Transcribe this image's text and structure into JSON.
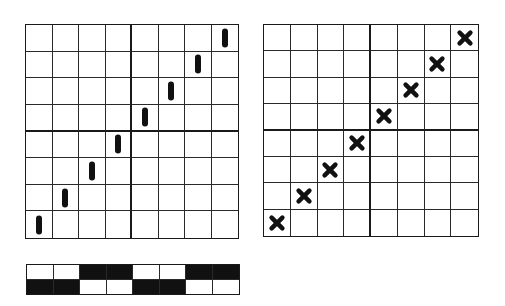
{
  "diagram": {
    "left_grid": {
      "rows": 8,
      "cols": 8,
      "mark_type": "vertical-bar",
      "marks": [
        {
          "row": 7,
          "col": 0
        },
        {
          "row": 6,
          "col": 1
        },
        {
          "row": 5,
          "col": 2
        },
        {
          "row": 4,
          "col": 3
        },
        {
          "row": 3,
          "col": 4
        },
        {
          "row": 2,
          "col": 5
        },
        {
          "row": 1,
          "col": 6
        },
        {
          "row": 0,
          "col": 7
        }
      ]
    },
    "right_grid": {
      "rows": 8,
      "cols": 8,
      "mark_type": "x-cross",
      "marks": [
        {
          "row": 7,
          "col": 0
        },
        {
          "row": 6,
          "col": 1
        },
        {
          "row": 5,
          "col": 2
        },
        {
          "row": 4,
          "col": 3
        },
        {
          "row": 3,
          "col": 4
        },
        {
          "row": 2,
          "col": 5
        },
        {
          "row": 1,
          "col": 6
        },
        {
          "row": 0,
          "col": 7
        }
      ]
    },
    "strip": {
      "rows": [
        [
          "white",
          "white",
          "black",
          "black",
          "white",
          "white",
          "black",
          "black"
        ],
        [
          "black",
          "black",
          "white",
          "white",
          "black",
          "black",
          "white",
          "white"
        ]
      ]
    },
    "colors": {
      "ink": "#111111",
      "line": "#2a2a2a",
      "background": "#ffffff"
    }
  }
}
